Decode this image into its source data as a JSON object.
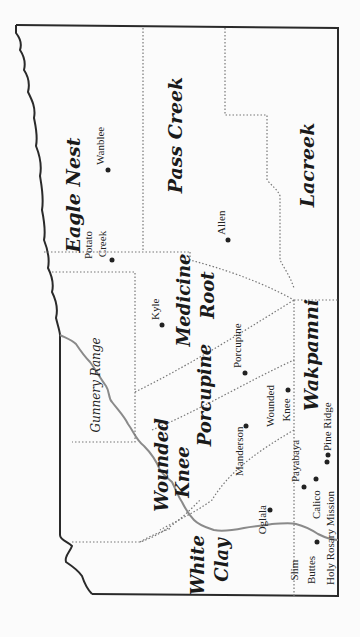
{
  "map": {
    "orientation": "rotated 90 degrees counter-clockwise",
    "colors": {
      "background": "#fbfbfb",
      "border": "#2a2a2a",
      "district_lines": "#777777",
      "river": "#808080",
      "text": "#1a1a1a"
    },
    "districts": [
      {
        "name": "Eagle Nest"
      },
      {
        "name": "Pass Creek"
      },
      {
        "name": "Lacreek"
      },
      {
        "name": "Medicine"
      },
      {
        "name": "Root"
      },
      {
        "name": "Porcupine"
      },
      {
        "name": "Wakpamni"
      },
      {
        "name": "Wounded"
      },
      {
        "name": "Knee"
      },
      {
        "name": "White"
      },
      {
        "name": "Clay"
      }
    ],
    "towns": [
      {
        "name": "Wanblee"
      },
      {
        "name": "Allen"
      },
      {
        "name": "Potato"
      },
      {
        "name": "Creek"
      },
      {
        "name": "Kyle"
      },
      {
        "name": "Porcupine"
      },
      {
        "name": "Manderson"
      },
      {
        "name": "Wounded"
      },
      {
        "name": "Knee"
      },
      {
        "name": "Oglala"
      },
      {
        "name": "Payabaya"
      },
      {
        "name": "Calico"
      },
      {
        "name": "Pine Ridge"
      },
      {
        "name": "Holy Rosary Mission"
      },
      {
        "name": "Slim"
      },
      {
        "name": "Buttes"
      }
    ],
    "features": [
      {
        "name": "Gunnery Range"
      }
    ]
  }
}
